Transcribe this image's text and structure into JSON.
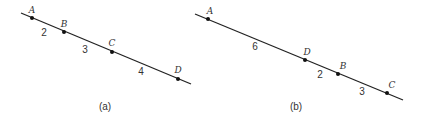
{
  "figures": [
    {
      "caption": "(a)",
      "line": {
        "x1": 21,
        "y1": 13,
        "x2": 191,
        "y2": 84
      },
      "points": [
        {
          "label": "A",
          "x": 32,
          "y": 18,
          "lx": 32,
          "ly": 13
        },
        {
          "label": "B",
          "x": 64,
          "y": 32,
          "lx": 64,
          "ly": 27
        },
        {
          "label": "C",
          "x": 112,
          "y": 52,
          "lx": 112,
          "ly": 46
        },
        {
          "label": "D",
          "x": 178,
          "y": 79,
          "lx": 178,
          "ly": 73
        }
      ],
      "segments": [
        {
          "label": "2",
          "x": 44,
          "y": 36
        },
        {
          "label": "3",
          "x": 85,
          "y": 53
        },
        {
          "label": "4",
          "x": 141,
          "y": 75
        }
      ],
      "caption_pos": {
        "x": 105,
        "y": 110
      }
    },
    {
      "caption": "(b)",
      "line": {
        "x1": 195,
        "y1": 14,
        "x2": 403,
        "y2": 100
      },
      "points": [
        {
          "label": "A",
          "x": 208,
          "y": 19,
          "lx": 210,
          "ly": 14
        },
        {
          "label": "D",
          "x": 305,
          "y": 60,
          "lx": 307,
          "ly": 55
        },
        {
          "label": "B",
          "x": 338,
          "y": 74,
          "lx": 343,
          "ly": 69
        },
        {
          "label": "C",
          "x": 387,
          "y": 93,
          "lx": 392,
          "ly": 88
        }
      ],
      "segments": [
        {
          "label": "6",
          "x": 255,
          "y": 50
        },
        {
          "label": "2",
          "x": 320,
          "y": 78
        },
        {
          "label": "3",
          "x": 362,
          "y": 95
        }
      ],
      "caption_pos": {
        "x": 296,
        "y": 110
      }
    }
  ]
}
